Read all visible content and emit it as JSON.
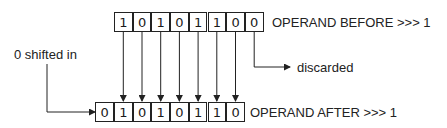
{
  "diagram": {
    "before": {
      "bits": [
        "1",
        "0",
        "1",
        "0",
        "1",
        "1",
        "0",
        "0"
      ],
      "label": "OPERAND BEFORE >>> 1"
    },
    "after": {
      "bits": [
        "0",
        "1",
        "0",
        "1",
        "0",
        "1",
        "1",
        "0"
      ],
      "label": "OPERAND AFTER >>> 1"
    },
    "shifted_in_label": "0 shifted in",
    "discarded_label": "discarded",
    "colors": {
      "line": "#222222",
      "background": "#ffffff"
    }
  }
}
